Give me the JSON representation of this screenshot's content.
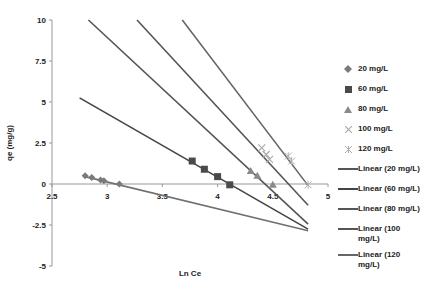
{
  "chart_data": {
    "type": "scatter",
    "title": "",
    "xlabel": "Ln Ce",
    "ylabel": "qe (mg/g)",
    "xlim": [
      2.5,
      5
    ],
    "ylim": [
      -5,
      10
    ],
    "xticks": [
      "2.5",
      "3",
      "3.5",
      "4",
      "4.5",
      "5"
    ],
    "yticks": [
      "10",
      "7.5",
      "5",
      "2.5",
      "0",
      "-2.5",
      "-5"
    ],
    "grid": false,
    "legend_position": "right",
    "series": [
      {
        "name": "20 mg/L",
        "marker": "diamond",
        "color": "#7a7a7a",
        "x": [
          2.8,
          2.86,
          2.94,
          2.97,
          3.11
        ],
        "y": [
          0.5,
          0.4,
          0.25,
          0.2,
          0.0
        ]
      },
      {
        "name": "60 mg/L",
        "marker": "square",
        "color": "#4a4a4a",
        "x": [
          3.77,
          3.88,
          4.0,
          4.11
        ],
        "y": [
          1.4,
          0.9,
          0.45,
          -0.05
        ]
      },
      {
        "name": "80 mg/L",
        "marker": "triangle",
        "color": "#8a8a8a",
        "x": [
          4.3,
          4.36,
          4.5
        ],
        "y": [
          0.8,
          0.5,
          -0.05
        ]
      },
      {
        "name": "100 mg/L",
        "marker": "x",
        "color": "#aaaaaa",
        "x": [
          4.4,
          4.44,
          4.47
        ],
        "y": [
          2.2,
          1.8,
          1.5
        ]
      },
      {
        "name": "120 mg/L",
        "marker": "star",
        "color": "#b0b0b0",
        "x": [
          4.64,
          4.67,
          4.82
        ],
        "y": [
          1.7,
          1.4,
          -0.05
        ]
      }
    ],
    "trendlines": [
      {
        "name": "Linear (20 mg/L)",
        "color": "#707070",
        "x": [
          2.8,
          4.82
        ],
        "y": [
          0.45,
          -2.85
        ]
      },
      {
        "name": "Linear (60 mg/L)",
        "color": "#444444",
        "x": [
          2.75,
          4.82
        ],
        "y": [
          5.25,
          -2.75
        ]
      },
      {
        "name": "Linear (80 mg/L)",
        "color": "#555555",
        "x": [
          2.83,
          4.82
        ],
        "y": [
          10.0,
          -2.45
        ]
      },
      {
        "name": "Linear (100 mg/L)",
        "color": "#555555",
        "x": [
          3.27,
          4.82
        ],
        "y": [
          10.0,
          -1.3
        ]
      },
      {
        "name": "Linear (120 mg/L)",
        "color": "#666666",
        "x": [
          3.68,
          4.82
        ],
        "y": [
          10.0,
          -0.1
        ]
      }
    ]
  },
  "legend": {
    "items": [
      {
        "label": "20 mg/L"
      },
      {
        "label": "60 mg/L"
      },
      {
        "label": "80 mg/L"
      },
      {
        "label": "100 mg/L"
      },
      {
        "label": "120 mg/L"
      },
      {
        "label": "Linear (20 mg/L)"
      },
      {
        "label": "Linear (60 mg/L)"
      },
      {
        "label": "Linear (80 mg/L)"
      },
      {
        "label": "Linear (100 mg/L)"
      },
      {
        "label": "Linear (120 mg/L)"
      }
    ]
  }
}
